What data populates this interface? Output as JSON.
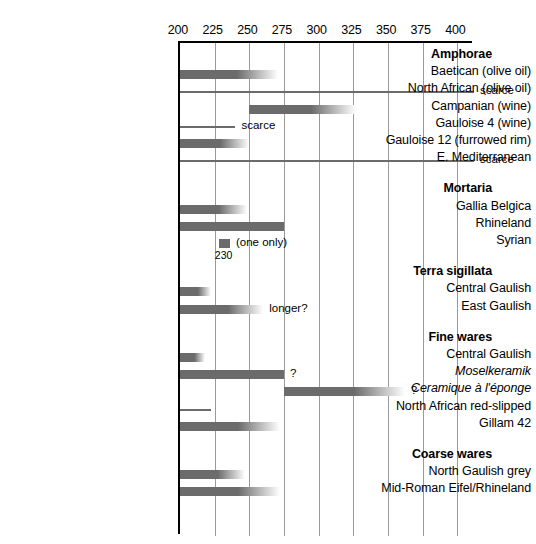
{
  "chart_data": {
    "type": "bar",
    "orientation": "horizontal",
    "title": "",
    "xlabel": "",
    "ylabel": "",
    "xlim": [
      200,
      412
    ],
    "xticks": [
      200,
      225,
      250,
      275,
      300,
      325,
      350,
      375,
      400
    ],
    "grid": true,
    "legend": "none",
    "axis_note": "Horizontal Gantt-style date ranges in years AD; faded bar ends indicate uncertain end dates",
    "sections": [
      {
        "name": "Amphorae",
        "rows": [
          {
            "label": "Baetican (olive oil)",
            "start": 200,
            "end": 271,
            "style": "fade",
            "note": ""
          },
          {
            "label": "North African (olive oil)",
            "start": 200,
            "end": 412,
            "style": "thin",
            "note": "scarce"
          },
          {
            "label": "Campanian (wine)",
            "start": 250,
            "end": 327,
            "style": "fade",
            "note": ""
          },
          {
            "label": "Gauloise 4 (wine)",
            "start": 200,
            "end": 240,
            "style": "thin",
            "note": "scarce"
          },
          {
            "label": "Gauloise 12 (furrowed rim)",
            "start": 200,
            "end": 250,
            "style": "fade",
            "note": ""
          },
          {
            "label": "E. Mediterranean",
            "start": 200,
            "end": 412,
            "style": "thin",
            "note": "scarce"
          }
        ]
      },
      {
        "name": "Mortaria",
        "rows": [
          {
            "label": "Gallia Belgica",
            "start": 200,
            "end": 248,
            "style": "fade",
            "note": ""
          },
          {
            "label": "Rhineland",
            "start": 200,
            "end": 275,
            "style": "solid",
            "note": ""
          },
          {
            "label": "Syrian",
            "start": 228,
            "end": 236,
            "style": "solid",
            "note": "(one only)",
            "value_label": "230"
          }
        ]
      },
      {
        "name": "Terra sigillata",
        "rows": [
          {
            "label": "Central Gaulish",
            "start": 200,
            "end": 222,
            "style": "fade",
            "note": ""
          },
          {
            "label": "East Gaulish",
            "start": 200,
            "end": 260,
            "style": "fade",
            "note": "longer?"
          }
        ]
      },
      {
        "name": "Fine wares",
        "rows": [
          {
            "label": "Central Gaulish",
            "start": 200,
            "end": 218,
            "style": "fade",
            "note": ""
          },
          {
            "label": "Moselkeramik",
            "start": 200,
            "end": 275,
            "style": "solid",
            "note": "?",
            "italic": true
          },
          {
            "label": "Ceramique à l'éponge",
            "start": 275,
            "end": 362,
            "style": "fade",
            "note": "?",
            "italic": true
          },
          {
            "label": "North African red-slipped",
            "start": 200,
            "end": 222,
            "style": "thin",
            "note": ""
          },
          {
            "label": "Gillam 42",
            "start": 200,
            "end": 272,
            "style": "fade",
            "note": ""
          }
        ]
      },
      {
        "name": "Coarse wares",
        "rows": [
          {
            "label": "North Gaulish grey",
            "start": 200,
            "end": 247,
            "style": "fade",
            "note": ""
          },
          {
            "label": "Mid-Roman Eifel/Rhineland",
            "start": 200,
            "end": 272,
            "style": "fade",
            "note": ""
          }
        ]
      }
    ]
  },
  "colors": {
    "bar": "#6b6b6b",
    "grid": "#9a9a9a",
    "axis": "#000000",
    "background": "#ffffff"
  }
}
